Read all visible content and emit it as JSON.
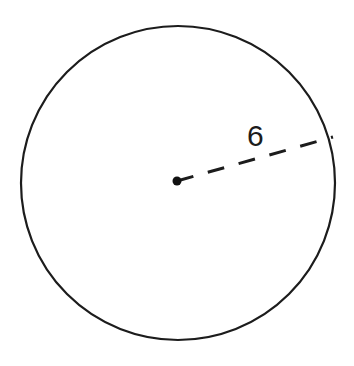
{
  "figure": {
    "name": "circle-with-radius",
    "background_color": "#ffffff",
    "stroke_color": "#1c1c1c",
    "label_color": "#1c1c1c"
  },
  "chart_data": {
    "type": "diagram",
    "title": "",
    "shape": "circle",
    "units": "",
    "canvas": {
      "width": 354,
      "height": 366
    },
    "circle": {
      "center_x": 178,
      "center_y": 183,
      "radius_px": 157,
      "stroke_width": 2.2,
      "fill": "none",
      "stroke": "#1c1c1c"
    },
    "center_point": {
      "label": "",
      "x": 177,
      "y": 181,
      "dot_radius_px": 4.5,
      "fill": "#111111"
    },
    "segments": [
      {
        "name": "radius",
        "style": "dashed",
        "value": 6,
        "label": "6",
        "from_x": 177,
        "from_y": 181,
        "to_x": 333,
        "to_y": 137,
        "stroke_width": 3,
        "dash_length": 17,
        "dash_gap": 15,
        "stroke": "#1c1c1c"
      }
    ],
    "annotations": [
      {
        "name": "radius-length-label",
        "text": "6",
        "x": 247,
        "y": 121,
        "font_size_px": 30,
        "color": "#1c1c1c"
      }
    ],
    "xlabel": "",
    "ylabel": "",
    "grid": false,
    "legend": false
  }
}
